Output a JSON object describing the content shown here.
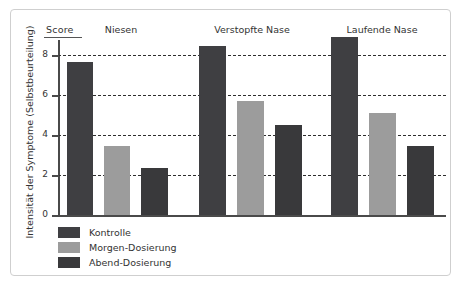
{
  "chart_data": {
    "type": "bar",
    "title": "",
    "score_header": "Score",
    "ylabel": "Intensität der Symptome (Selbstbeurteilung)",
    "xlabel": "",
    "categories": [
      "Niesen",
      "Verstopfte Nase",
      "Laufende Nase"
    ],
    "series": [
      {
        "name": "Kontrolle",
        "color": "#3f3f42",
        "values": [
          7.65,
          8.45,
          8.9
        ]
      },
      {
        "name": "Morgen-Dosierung",
        "color": "#9c9c9c",
        "values": [
          3.45,
          5.7,
          5.1
        ]
      },
      {
        "name": "Abend-Dosierung",
        "color": "#39393b",
        "values": [
          2.35,
          4.5,
          3.45
        ]
      }
    ],
    "yticks": [
      "0",
      "2",
      "4",
      "6",
      "8"
    ],
    "ytick_values": [
      0,
      2,
      4,
      6,
      8
    ],
    "ylim": [
      0,
      9.6
    ],
    "grid": "horizontal-dashed",
    "legend_position": "bottom-left",
    "axis_color": "#4a4a4a",
    "grid_color": "#2e2e2e",
    "background": "#ffffff",
    "frame_color": "#cfcfcf"
  },
  "legend": {
    "items": [
      {
        "label": "Kontrolle",
        "color": "#3f3f42"
      },
      {
        "label": "Morgen-Dosierung",
        "color": "#9c9c9c"
      },
      {
        "label": "Abend-Dosierung",
        "color": "#39393b"
      }
    ]
  }
}
